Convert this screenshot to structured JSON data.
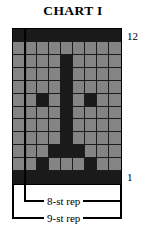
{
  "title": "CHART I",
  "axis": {
    "row_label_top": "12",
    "row_label_bottom": "1"
  },
  "legend": {
    "inner_repeat": "8-st rep",
    "outer_repeat": "9-st rep"
  },
  "colors": {
    "background_cell": "#848484",
    "filled_cell": "#1a1a1a",
    "grid_line": "#1c1c1c",
    "border": "#000000",
    "page": "#ffffff"
  },
  "chart_data": {
    "type": "heatmap",
    "title": "CHART I",
    "xlabel": "",
    "ylabel": "",
    "columns": 9,
    "rows": 12,
    "row_labels": [
      "12",
      "11",
      "10",
      "9",
      "8",
      "7",
      "6",
      "5",
      "4",
      "3",
      "2",
      "1"
    ],
    "legend_entries": [
      "8-st rep",
      "9-st rep"
    ],
    "value_legend": {
      "0": "background stitch",
      "1": "filled stitch"
    },
    "grid": [
      [
        1,
        1,
        1,
        1,
        1,
        1,
        1,
        1,
        1
      ],
      [
        0,
        0,
        0,
        0,
        0,
        0,
        0,
        0,
        0
      ],
      [
        0,
        0,
        0,
        0,
        1,
        0,
        0,
        0,
        0
      ],
      [
        0,
        0,
        0,
        0,
        1,
        0,
        0,
        0,
        0
      ],
      [
        0,
        0,
        0,
        0,
        1,
        0,
        0,
        0,
        0
      ],
      [
        0,
        0,
        1,
        0,
        1,
        0,
        1,
        0,
        0
      ],
      [
        0,
        0,
        0,
        0,
        1,
        0,
        0,
        0,
        0
      ],
      [
        0,
        0,
        0,
        0,
        1,
        0,
        0,
        0,
        0
      ],
      [
        0,
        0,
        0,
        0,
        1,
        0,
        0,
        0,
        0
      ],
      [
        0,
        0,
        0,
        1,
        1,
        1,
        0,
        0,
        0
      ],
      [
        0,
        0,
        1,
        0,
        0,
        0,
        1,
        0,
        0
      ],
      [
        1,
        1,
        1,
        1,
        1,
        1,
        1,
        1,
        1
      ]
    ]
  }
}
